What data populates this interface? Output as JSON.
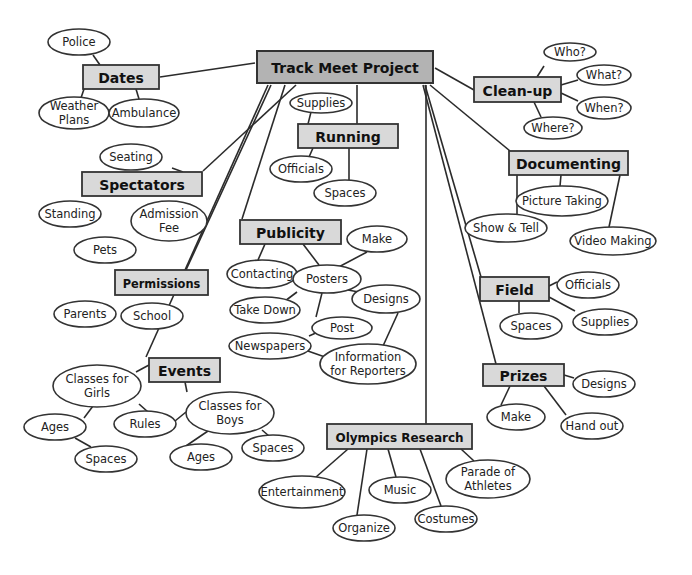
{
  "title": "Track Meet Project",
  "colors": {
    "root_fill": "#b3b3b3",
    "topic_fill": "#d9d9d9",
    "stroke": "#333333",
    "oval_fill": "#ffffff"
  },
  "root": {
    "id": "root",
    "label": "Track Meet Project",
    "x": 257,
    "y": 51,
    "w": 176,
    "h": 32
  },
  "topics": [
    {
      "id": "dates",
      "label": "Dates",
      "x": 83,
      "y": 65,
      "w": 76,
      "h": 24
    },
    {
      "id": "running",
      "label": "Running",
      "x": 298,
      "y": 124,
      "w": 100,
      "h": 24
    },
    {
      "id": "cleanup",
      "label": "Clean-up",
      "x": 474,
      "y": 77,
      "w": 87,
      "h": 25
    },
    {
      "id": "documenting",
      "label": "Documenting",
      "x": 509,
      "y": 151,
      "w": 119,
      "h": 24
    },
    {
      "id": "spectators",
      "label": "Spectators",
      "x": 82,
      "y": 172,
      "w": 120,
      "h": 24
    },
    {
      "id": "publicity",
      "label": "Publicity",
      "x": 240,
      "y": 220,
      "w": 101,
      "h": 24
    },
    {
      "id": "permissions",
      "label": "Permissions",
      "x": 115,
      "y": 270,
      "w": 93,
      "h": 25
    },
    {
      "id": "field",
      "label": "Field",
      "x": 480,
      "y": 277,
      "w": 69,
      "h": 24
    },
    {
      "id": "events",
      "label": "Events",
      "x": 149,
      "y": 358,
      "w": 71,
      "h": 24
    },
    {
      "id": "prizes",
      "label": "Prizes",
      "x": 483,
      "y": 364,
      "w": 81,
      "h": 22
    },
    {
      "id": "olympics",
      "label": "Olympics Research",
      "x": 327,
      "y": 424,
      "w": 145,
      "h": 25
    }
  ],
  "leaves": [
    {
      "id": "police",
      "label": "Police",
      "cx": 79,
      "cy": 42,
      "rx": 31,
      "ry": 13
    },
    {
      "id": "weather",
      "label": "Weather Plans",
      "lines": [
        "Weather",
        "Plans"
      ],
      "cx": 74,
      "cy": 113,
      "rx": 35,
      "ry": 16
    },
    {
      "id": "ambulance",
      "label": "Ambulance",
      "cx": 144,
      "cy": 113,
      "rx": 35,
      "ry": 14
    },
    {
      "id": "run_supplies",
      "label": "Supplies",
      "cx": 321,
      "cy": 103,
      "rx": 31,
      "ry": 10
    },
    {
      "id": "run_officials",
      "label": "Officials",
      "cx": 301,
      "cy": 169,
      "rx": 31,
      "ry": 13
    },
    {
      "id": "run_spaces",
      "label": "Spaces",
      "cx": 345,
      "cy": 193,
      "rx": 31,
      "ry": 13
    },
    {
      "id": "who",
      "label": "Who?",
      "cx": 570,
      "cy": 52,
      "rx": 26,
      "ry": 9
    },
    {
      "id": "what",
      "label": "What?",
      "cx": 604,
      "cy": 75,
      "rx": 27,
      "ry": 10
    },
    {
      "id": "when",
      "label": "When?",
      "cx": 604,
      "cy": 108,
      "rx": 27,
      "ry": 11
    },
    {
      "id": "where",
      "label": "Where?",
      "cx": 553,
      "cy": 128,
      "rx": 29,
      "ry": 11
    },
    {
      "id": "picture",
      "label": "Picture Taking",
      "cx": 562,
      "cy": 201,
      "rx": 46,
      "ry": 15
    },
    {
      "id": "show",
      "label": "Show & Tell",
      "cx": 506,
      "cy": 228,
      "rx": 41,
      "ry": 14
    },
    {
      "id": "video",
      "label": "Video Making",
      "cx": 613,
      "cy": 241,
      "rx": 43,
      "ry": 14
    },
    {
      "id": "seating",
      "label": "Seating",
      "cx": 131,
      "cy": 157,
      "rx": 31,
      "ry": 13
    },
    {
      "id": "standing",
      "label": "Standing",
      "cx": 70,
      "cy": 214,
      "rx": 31,
      "ry": 13
    },
    {
      "id": "admission",
      "label": "Admission Fee",
      "lines": [
        "Admission",
        "Fee"
      ],
      "cx": 169,
      "cy": 221,
      "rx": 38,
      "ry": 20
    },
    {
      "id": "pets",
      "label": "Pets",
      "cx": 105,
      "cy": 250,
      "rx": 31,
      "ry": 13
    },
    {
      "id": "parents",
      "label": "Parents",
      "cx": 85,
      "cy": 314,
      "rx": 31,
      "ry": 13
    },
    {
      "id": "school",
      "label": "School",
      "cx": 152,
      "cy": 316,
      "rx": 31,
      "ry": 13
    },
    {
      "id": "make",
      "label": "Make",
      "cx": 377,
      "cy": 239,
      "rx": 30,
      "ry": 13
    },
    {
      "id": "contacting",
      "label": "Contacting",
      "cx": 262,
      "cy": 274,
      "rx": 35,
      "ry": 14
    },
    {
      "id": "posters",
      "label": "Posters",
      "cx": 327,
      "cy": 279,
      "rx": 34,
      "ry": 14
    },
    {
      "id": "designs_pub",
      "label": "Designs",
      "cx": 386,
      "cy": 299,
      "rx": 34,
      "ry": 14
    },
    {
      "id": "takedown",
      "label": "Take Down",
      "cx": 265,
      "cy": 310,
      "rx": 35,
      "ry": 13
    },
    {
      "id": "post",
      "label": "Post",
      "cx": 342,
      "cy": 328,
      "rx": 30,
      "ry": 11
    },
    {
      "id": "newspapers",
      "label": "Newspapers",
      "cx": 270,
      "cy": 346,
      "rx": 41,
      "ry": 13
    },
    {
      "id": "info",
      "label": "Information for Reporters",
      "lines": [
        "Information",
        "for Reporters"
      ],
      "cx": 368,
      "cy": 364,
      "rx": 48,
      "ry": 20
    },
    {
      "id": "field_officials",
      "label": "Officials",
      "cx": 588,
      "cy": 285,
      "rx": 31,
      "ry": 13
    },
    {
      "id": "field_spaces",
      "label": "Spaces",
      "cx": 531,
      "cy": 326,
      "rx": 31,
      "ry": 13
    },
    {
      "id": "field_supplies",
      "label": "Supplies",
      "cx": 605,
      "cy": 322,
      "rx": 32,
      "ry": 13
    },
    {
      "id": "girls",
      "label": "Classes for Girls",
      "lines": [
        "Classes for",
        "Girls"
      ],
      "cx": 97,
      "cy": 386,
      "rx": 44,
      "ry": 21
    },
    {
      "id": "ages_girls",
      "label": "Ages",
      "cx": 55,
      "cy": 427,
      "rx": 31,
      "ry": 13
    },
    {
      "id": "rules",
      "label": "Rules",
      "cx": 145,
      "cy": 424,
      "rx": 31,
      "ry": 13
    },
    {
      "id": "spaces_girls",
      "label": "Spaces",
      "cx": 106,
      "cy": 459,
      "rx": 31,
      "ry": 13
    },
    {
      "id": "boys",
      "label": "Classes for Boys",
      "lines": [
        "Classes for",
        "Boys"
      ],
      "cx": 230,
      "cy": 413,
      "rx": 44,
      "ry": 21
    },
    {
      "id": "ages_boys",
      "label": "Ages",
      "cx": 201,
      "cy": 457,
      "rx": 31,
      "ry": 13
    },
    {
      "id": "spaces_boys",
      "label": "Spaces",
      "cx": 273,
      "cy": 448,
      "rx": 31,
      "ry": 13
    },
    {
      "id": "prize_designs",
      "label": "Designs",
      "cx": 604,
      "cy": 384,
      "rx": 31,
      "ry": 13
    },
    {
      "id": "prize_make",
      "label": "Make",
      "cx": 516,
      "cy": 417,
      "rx": 29,
      "ry": 13
    },
    {
      "id": "handout",
      "label": "Hand out",
      "cx": 592,
      "cy": 426,
      "rx": 31,
      "ry": 13
    },
    {
      "id": "entertainment",
      "label": "Entertainment",
      "cx": 302,
      "cy": 492,
      "rx": 43,
      "ry": 16
    },
    {
      "id": "music",
      "label": "Music",
      "cx": 400,
      "cy": 490,
      "rx": 31,
      "ry": 13
    },
    {
      "id": "parade",
      "label": "Parade of Athletes",
      "lines": [
        "Parade of",
        "Athletes"
      ],
      "cx": 488,
      "cy": 479,
      "rx": 42,
      "ry": 19
    },
    {
      "id": "organize",
      "label": "Organize",
      "cx": 364,
      "cy": 528,
      "rx": 31,
      "ry": 13
    },
    {
      "id": "costumes",
      "label": "Costumes",
      "cx": 446,
      "cy": 519,
      "rx": 31,
      "ry": 13
    }
  ],
  "edges": [
    [
      160,
      77,
      255,
      63
    ],
    [
      296,
      85,
      203,
      171
    ],
    [
      271,
      85,
      186,
      270
    ],
    [
      268,
      85,
      146,
      357
    ],
    [
      285,
      85,
      242,
      219
    ],
    [
      357,
      85,
      357,
      124
    ],
    [
      426,
      85,
      426,
      424
    ],
    [
      435,
      68,
      474,
      90
    ],
    [
      430,
      85,
      510,
      151
    ],
    [
      425,
      85,
      481,
      277
    ],
    [
      423,
      85,
      496,
      364
    ],
    [
      100,
      65,
      93,
      55
    ],
    [
      84,
      89,
      81,
      98
    ],
    [
      136,
      89,
      139,
      99
    ],
    [
      308,
      124,
      311,
      112
    ],
    [
      313,
      148,
      309,
      157
    ],
    [
      349,
      148,
      349,
      180
    ],
    [
      537,
      77,
      544,
      66
    ],
    [
      561,
      85,
      578,
      80
    ],
    [
      561,
      93,
      578,
      101
    ],
    [
      534,
      102,
      541,
      117
    ],
    [
      561,
      175,
      560,
      186
    ],
    [
      517,
      175,
      517,
      214
    ],
    [
      620,
      175,
      609,
      227
    ],
    [
      183,
      172,
      172,
      168
    ],
    [
      265,
      244,
      258,
      260
    ],
    [
      303,
      244,
      319,
      265
    ],
    [
      333,
      270,
      367,
      252
    ],
    [
      348,
      290,
      364,
      293
    ],
    [
      297,
      292,
      285,
      301
    ],
    [
      322,
      293,
      316,
      317
    ],
    [
      309,
      336,
      318,
      332
    ],
    [
      305,
      350,
      325,
      357
    ],
    [
      398,
      313,
      383,
      346
    ],
    [
      549,
      286,
      557,
      282
    ],
    [
      519,
      301,
      519,
      313
    ],
    [
      549,
      297,
      575,
      311
    ],
    [
      149,
      365,
      136,
      372
    ],
    [
      185,
      382,
      187,
      392
    ],
    [
      93,
      406,
      84,
      418
    ],
    [
      139,
      404,
      148,
      412
    ],
    [
      75,
      438,
      91,
      447
    ],
    [
      175,
      421,
      186,
      412
    ],
    [
      208,
      431,
      180,
      450
    ],
    [
      262,
      430,
      269,
      436
    ],
    [
      564,
      375,
      574,
      378
    ],
    [
      510,
      386,
      501,
      405
    ],
    [
      544,
      386,
      566,
      415
    ],
    [
      348,
      449,
      316,
      477
    ],
    [
      367,
      449,
      357,
      515
    ],
    [
      388,
      449,
      396,
      477
    ],
    [
      420,
      449,
      441,
      506
    ],
    [
      461,
      449,
      474,
      461
    ]
  ]
}
